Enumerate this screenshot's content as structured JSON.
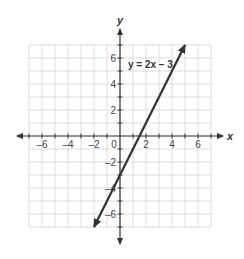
{
  "chart_data": {
    "type": "line",
    "title": "",
    "xlabel": "x",
    "ylabel": "y",
    "xlim": [
      -7,
      7
    ],
    "ylim": [
      -7,
      7
    ],
    "grid": true,
    "x_ticks": [
      -6,
      -4,
      -2,
      0,
      2,
      4,
      6
    ],
    "y_ticks": [
      6,
      4,
      2,
      -2,
      -4,
      -6
    ],
    "x_tick_labels": [
      "–6",
      "–4",
      "–2",
      "0",
      "2",
      "4",
      "6"
    ],
    "y_tick_labels": [
      "6",
      "4",
      "2",
      "–2",
      "–4",
      "–6"
    ],
    "series": [
      {
        "name": "y = 2x – 3",
        "equation": "y = 2x - 3",
        "slope": 2,
        "intercept": -3,
        "x": [
          -2,
          5
        ],
        "y": [
          -7,
          7
        ],
        "arrows_both_ends": true
      }
    ],
    "annotations": [
      {
        "text": "y = 2x – 3",
        "x": 0.5,
        "y": 5.5
      }
    ],
    "colors": {
      "line": "#333333",
      "grid": "#dddddd",
      "axis": "#333333"
    }
  }
}
